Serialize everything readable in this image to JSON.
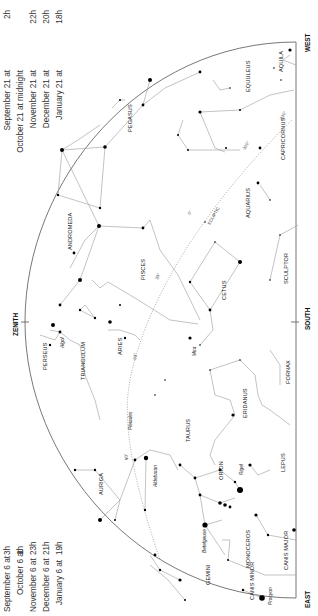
{
  "time_table_top": [
    {
      "date": "September 21 at",
      "time": "2h"
    },
    {
      "date": "October 21 at midnight",
      "time": ""
    },
    {
      "date": "November 21 at",
      "time": "22h"
    },
    {
      "date": "December 21 at",
      "time": "20h"
    },
    {
      "date": "January 21 at",
      "time": "18h"
    }
  ],
  "time_table_bottom": [
    {
      "date": "September 6 at",
      "time": "3h"
    },
    {
      "date": "October 6 at",
      "time": "1h"
    },
    {
      "date": "November 6 at",
      "time": "23h"
    },
    {
      "date": "December 6 at",
      "time": "21h"
    },
    {
      "date": "January 6 at",
      "time": "19h"
    }
  ],
  "directions": {
    "west": "WEST",
    "east": "EAST",
    "south": "SOUTH",
    "zenith": "ZENITH"
  },
  "ecliptic": {
    "label": "ECLIPTIC",
    "ticks": [
      "330°",
      "300°",
      "0°",
      "30°",
      "60°",
      "90°"
    ]
  },
  "constellations": [
    "AQUILA",
    "EQUULEUS",
    "CAPRICORNUS",
    "PEGASUS",
    "AQUARIUS",
    "ANDROMEDA",
    "PISCES",
    "SCULPTOR",
    "CETUS",
    "PERSEUS",
    "TRIANGULUM",
    "ARIES",
    "FORNAX",
    "ERIDANUS",
    "TAURUS",
    "AURIGA",
    "ORION",
    "LEPUS",
    "MONOCEROS",
    "CANIS MAJOR",
    "GEMINI",
    "CANIS MINOR"
  ],
  "stars_named": [
    "Algol",
    "Pleiades",
    "Mira",
    "Aldebaran",
    "Rigel",
    "Betelgeuse",
    "Procyon"
  ],
  "colors": {
    "line": "#9a9a9a",
    "horizon": "#555555",
    "star": "#000000",
    "text": "#222222"
  }
}
